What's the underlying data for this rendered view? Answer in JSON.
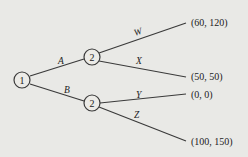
{
  "diagram": {
    "type": "game-tree",
    "nodes": {
      "root": {
        "label": "1"
      },
      "upper": {
        "label": "2"
      },
      "lower": {
        "label": "2"
      }
    },
    "edges": {
      "A": {
        "label": "A"
      },
      "B": {
        "label": "B"
      },
      "W": {
        "label": "W"
      },
      "X": {
        "label": "X"
      },
      "Y": {
        "label": "Y"
      },
      "Z": {
        "label": "Z"
      }
    },
    "payoffs": {
      "W": "(60, 120)",
      "X": "(50, 50)",
      "Y": "(0, 0)",
      "Z": "(100, 150)"
    }
  }
}
